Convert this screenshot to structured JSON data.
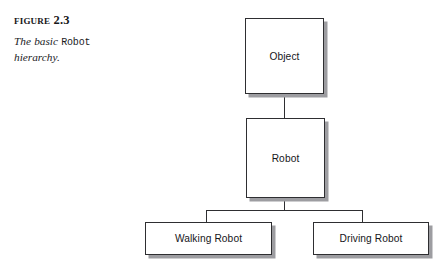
{
  "caption": {
    "figure_label": "Figure 2.3",
    "description_parts": {
      "before": "The basic ",
      "code": "Robot",
      "after": " hierarchy."
    }
  },
  "diagram": {
    "type": "tree-hierarchy",
    "nodes": [
      {
        "id": "object",
        "label": "Object"
      },
      {
        "id": "robot",
        "label": "Robot"
      },
      {
        "id": "walking",
        "label": "Walking Robot"
      },
      {
        "id": "driving",
        "label": "Driving Robot"
      }
    ],
    "edges": [
      {
        "from": "object",
        "to": "robot"
      },
      {
        "from": "robot",
        "to": "walking"
      },
      {
        "from": "robot",
        "to": "driving"
      }
    ]
  },
  "colors": {
    "box_border": "#2e2e31",
    "box_fill": "#ffffff",
    "box_shadow": "#9d9da1",
    "connector": "#2e2e31",
    "text": "#16161a",
    "page_background": "#ffffff"
  }
}
